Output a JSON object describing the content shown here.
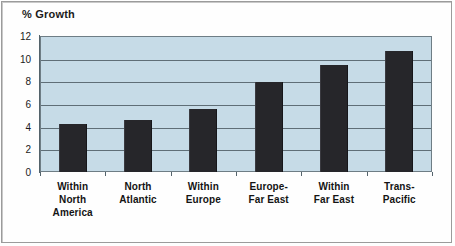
{
  "chart_data": {
    "type": "bar",
    "title": "% Growth",
    "xlabel": "",
    "ylabel": "% Growth",
    "ylim": [
      0,
      12
    ],
    "yticks": [
      0,
      2,
      4,
      6,
      8,
      10,
      12
    ],
    "ytick_labels": [
      "0",
      "2",
      "4",
      "6",
      "8",
      "10",
      "12"
    ],
    "grid": true,
    "legend": false,
    "categories": [
      "Within\nNorth\nAmerica",
      "North\nAtlantic",
      "Within\nEurope",
      "Europe-\nFar East",
      "Within\nFar East",
      "Trans-\nPacific"
    ],
    "values": [
      4.2,
      4.6,
      5.6,
      7.9,
      9.4,
      10.7
    ],
    "bar_color": "#26262a",
    "plot_background": "#c6dbe7",
    "gridline_color": "#5f6e77"
  },
  "title": "% Growth"
}
